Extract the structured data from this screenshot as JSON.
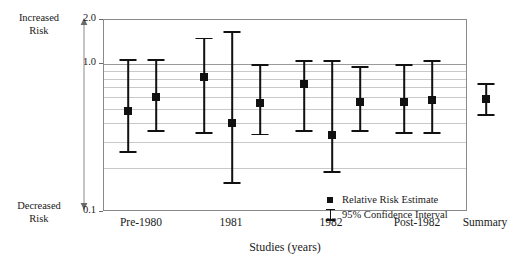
{
  "chart_data": {
    "type": "scatter",
    "title": "",
    "xlabel": "Studies (years)",
    "ylabel": "",
    "yscale": "log",
    "ylim": [
      0.1,
      2.0
    ],
    "ytick_labels": [
      "2.0",
      "1.0",
      "0.1"
    ],
    "ytick_values": [
      2.0,
      1.0,
      0.1
    ],
    "gridlines": [
      1.0,
      0.9,
      0.8,
      0.7,
      0.6,
      0.5,
      0.4,
      0.3,
      0.2
    ],
    "grid": true,
    "legend_position": "inside-bottom-center",
    "axis_direction_top": "Increased Risk",
    "axis_direction_bottom": "Decreased Risk",
    "categories": [
      "Pre-1980",
      "1981",
      "1982",
      "Post-1982",
      "Summary"
    ],
    "series": [
      {
        "name": "Relative Risk Estimate",
        "points": [
          {
            "group": "Pre-1980",
            "estimate": 0.48,
            "ci_low": 0.26,
            "ci_high": 1.08
          },
          {
            "group": "Pre-1980",
            "estimate": 0.6,
            "ci_low": 0.36,
            "ci_high": 1.08
          },
          {
            "group": "1981",
            "estimate": 0.82,
            "ci_low": 0.35,
            "ci_high": 1.52
          },
          {
            "group": "1981",
            "estimate": 0.4,
            "ci_low": 0.16,
            "ci_high": 1.68
          },
          {
            "group": "1981",
            "estimate": 0.55,
            "ci_low": 0.34,
            "ci_high": 1.0
          },
          {
            "group": "1982",
            "estimate": 0.74,
            "ci_low": 0.36,
            "ci_high": 1.07
          },
          {
            "group": "1982",
            "estimate": 0.33,
            "ci_low": 0.19,
            "ci_high": 1.07
          },
          {
            "group": "1982",
            "estimate": 0.56,
            "ci_low": 0.36,
            "ci_high": 0.98
          },
          {
            "group": "Post-1982",
            "estimate": 0.56,
            "ci_low": 0.35,
            "ci_high": 1.0
          },
          {
            "group": "Post-1982",
            "estimate": 0.57,
            "ci_low": 0.35,
            "ci_high": 1.07
          },
          {
            "group": "Summary",
            "estimate": 0.58,
            "ci_low": 0.46,
            "ci_high": 0.75
          }
        ]
      }
    ],
    "legend": [
      {
        "label": "Relative Risk Estimate",
        "marker": "square"
      },
      {
        "label": "95% Confidence Interval",
        "marker": "error-bar"
      }
    ],
    "colors": {
      "marker": "#111111",
      "grid": "#c9c9c9",
      "axis": "#8a8a8a"
    }
  },
  "axis": {
    "increased_risk": "Increased\nRisk",
    "increased_risk_line1": "Increased",
    "increased_risk_line2": "Risk",
    "decreased_risk_line1": "Decreased",
    "decreased_risk_line2": "Risk",
    "y_top": "2.0",
    "y_mid": "1.0",
    "y_bottom": "0.1",
    "x_title": "Studies (years)"
  },
  "x_categories": [
    {
      "label": "Pre-1980"
    },
    {
      "label": "1981"
    },
    {
      "label": "1982"
    },
    {
      "label": "Post-1982"
    },
    {
      "label": "Summary"
    }
  ],
  "legend": {
    "estimate_label": "Relative Risk Estimate",
    "ci_label": "95% Confidence Interval"
  }
}
